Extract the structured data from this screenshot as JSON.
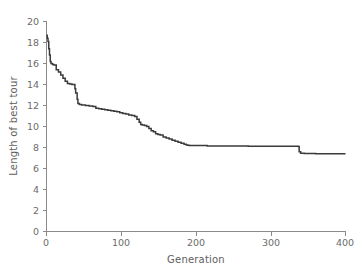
{
  "chart_data": {
    "type": "line",
    "title": "",
    "xlabel": "Generation",
    "ylabel": "Length of best tour",
    "xlim": [
      0,
      400
    ],
    "ylim": [
      0,
      20
    ],
    "xticks": [
      0,
      100,
      200,
      300,
      400
    ],
    "yticks": [
      0,
      2,
      4,
      6,
      8,
      10,
      12,
      14,
      16,
      18,
      20
    ],
    "grid": false,
    "legend": null,
    "line_color": "#3a3a3a",
    "axis_color": "#8a8a8a",
    "label_color": "#6b6b6b",
    "series": [
      {
        "name": "best tour length",
        "x": [
          0,
          1,
          2,
          3,
          4,
          5,
          6,
          8,
          10,
          13,
          16,
          19,
          22,
          25,
          28,
          31,
          34,
          37,
          38,
          39,
          41,
          42,
          44,
          47,
          52,
          57,
          62,
          66,
          70,
          74,
          78,
          82,
          86,
          90,
          94,
          98,
          102,
          106,
          110,
          114,
          118,
          121,
          124,
          126,
          128,
          131,
          134,
          137,
          140,
          143,
          146,
          149,
          152,
          156,
          160,
          164,
          168,
          172,
          176,
          180,
          184,
          187,
          189,
          191,
          196,
          205,
          215,
          230,
          250,
          270,
          290,
          310,
          325,
          334,
          337,
          338,
          340,
          345,
          360,
          380,
          400
        ],
        "y": [
          18.7,
          18.4,
          18.1,
          17.4,
          16.8,
          16.2,
          16.0,
          15.9,
          15.85,
          15.4,
          15.2,
          14.9,
          14.6,
          14.3,
          14.1,
          14.05,
          14.0,
          14.0,
          13.6,
          13.2,
          12.6,
          12.2,
          12.1,
          12.05,
          12.0,
          11.95,
          11.9,
          11.75,
          11.7,
          11.65,
          11.6,
          11.55,
          11.5,
          11.45,
          11.4,
          11.3,
          11.25,
          11.2,
          11.1,
          11.05,
          10.95,
          10.7,
          10.4,
          10.2,
          10.15,
          10.1,
          10.0,
          9.8,
          9.6,
          9.5,
          9.3,
          9.25,
          9.2,
          9.0,
          8.9,
          8.8,
          8.7,
          8.6,
          8.5,
          8.4,
          8.3,
          8.25,
          8.22,
          8.2,
          8.2,
          8.18,
          8.15,
          8.15,
          8.14,
          8.13,
          8.12,
          8.12,
          8.12,
          8.12,
          8.1,
          7.6,
          7.45,
          7.42,
          7.4,
          7.4,
          7.4
        ]
      }
    ]
  },
  "axes": {
    "x_title": "Generation",
    "y_title": "Length of best tour",
    "x_tick_labels": [
      "0",
      "100",
      "200",
      "300",
      "400"
    ],
    "y_tick_labels": [
      "0",
      "2",
      "4",
      "6",
      "8",
      "10",
      "12",
      "14",
      "16",
      "18",
      "20"
    ]
  }
}
